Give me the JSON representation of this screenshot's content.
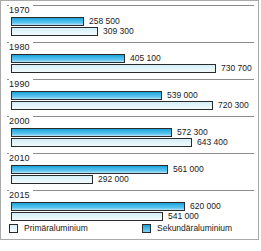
{
  "chart_data": {
    "type": "bar",
    "orientation": "horizontal",
    "title": "",
    "xlabel": "",
    "ylabel": "",
    "categories": [
      "1970",
      "1980",
      "1990",
      "2000",
      "2010",
      "2015"
    ],
    "xlim": [
      0,
      730700
    ],
    "grid": false,
    "legend_position": "bottom",
    "series": [
      {
        "name": "Sekundäraluminium",
        "color": "#39b4e6",
        "values": [
          258500,
          405100,
          539000,
          572300,
          561000,
          620000
        ],
        "labels": [
          "258 500",
          "405 100",
          "539 000",
          "572 300",
          "561 000",
          "620 000"
        ]
      },
      {
        "name": "Primäraluminium",
        "color": "#e3f4fa",
        "values": [
          309300,
          730700,
          720300,
          643400,
          292000,
          541000
        ],
        "labels": [
          "309 300",
          "730 700",
          "720 300",
          "643 400",
          "292 000",
          "541 000"
        ]
      }
    ]
  },
  "groups": [
    {
      "year": "1970",
      "secondary": {
        "label": "258 500",
        "value": 258500
      },
      "primary": {
        "label": "309 300",
        "value": 309300
      }
    },
    {
      "year": "1980",
      "secondary": {
        "label": "405 100",
        "value": 405100
      },
      "primary": {
        "label": "730 700",
        "value": 730700
      }
    },
    {
      "year": "1990",
      "secondary": {
        "label": "539 000",
        "value": 539000
      },
      "primary": {
        "label": "720 300",
        "value": 720300
      }
    },
    {
      "year": "2000",
      "secondary": {
        "label": "572 300",
        "value": 572300
      },
      "primary": {
        "label": "643 400",
        "value": 643400
      }
    },
    {
      "year": "2010",
      "secondary": {
        "label": "561 000",
        "value": 561000
      },
      "primary": {
        "label": "292 000",
        "value": 292000
      }
    },
    {
      "year": "2015",
      "secondary": {
        "label": "620 000",
        "value": 620000
      },
      "primary": {
        "label": "541 000",
        "value": 541000
      }
    }
  ],
  "legend": {
    "primary_label": "Primäraluminium",
    "secondary_label": "Sekundäraluminium",
    "primary_color": "#e3f4fa",
    "secondary_color": "#39b4e6"
  },
  "caption": {
    "text": ""
  }
}
